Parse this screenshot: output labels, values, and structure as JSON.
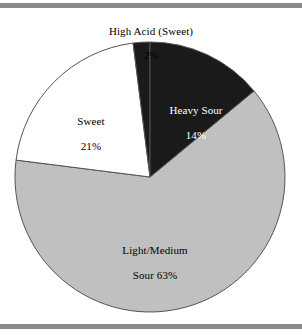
{
  "figure": {
    "top_rule_color": "#8a8a8a",
    "bottom_rule_color": "#8a8a8a",
    "background": "#ffffff"
  },
  "chart_data": {
    "type": "pie",
    "title": "",
    "subtitle": "",
    "xlabel": "",
    "ylabel": "",
    "grid": false,
    "legend_position": "none",
    "labels_inside": true,
    "units": "percent",
    "total": 100,
    "categories": [
      "High Acid (Sweet)",
      "Heavy Sour",
      "Light/Medium Sour",
      "Sweet"
    ],
    "values": [
      2,
      14,
      63,
      21
    ],
    "slices": [
      {
        "name": "High Acid (Sweet)",
        "value": 2,
        "percent_text": "2%",
        "label_line1": "High Acid (Sweet)",
        "label_line2": "2%",
        "color": "#1a1a1a",
        "text_color": "#000000",
        "label_placement": "outside-top",
        "start_angle_deg": -7.2,
        "end_angle_deg": 0.0
      },
      {
        "name": "Heavy Sour",
        "value": 14,
        "percent_text": "14%",
        "label_line1": "Heavy Sour",
        "label_line2": "14%",
        "color": "#1a1a1a",
        "text_color": "#ffffff",
        "label_placement": "inside",
        "start_angle_deg": 0.0,
        "end_angle_deg": 50.4
      },
      {
        "name": "Light/Medium Sour",
        "value": 63,
        "percent_text": "63%",
        "label_line1": "Light/Medium",
        "label_line2": "Sour 63%",
        "color": "#c0c0c0",
        "text_color": "#000000",
        "label_placement": "inside",
        "start_angle_deg": 50.4,
        "end_angle_deg": 277.2
      },
      {
        "name": "Sweet",
        "value": 21,
        "percent_text": "21%",
        "label_line1": "Sweet",
        "label_line2": "21%",
        "color": "#ffffff",
        "text_color": "#000000",
        "label_placement": "inside",
        "start_angle_deg": 277.2,
        "end_angle_deg": 352.8
      }
    ],
    "geometry": {
      "center_x": 150,
      "center_y": 167,
      "radius": 135,
      "outline_color": "#555555"
    }
  }
}
